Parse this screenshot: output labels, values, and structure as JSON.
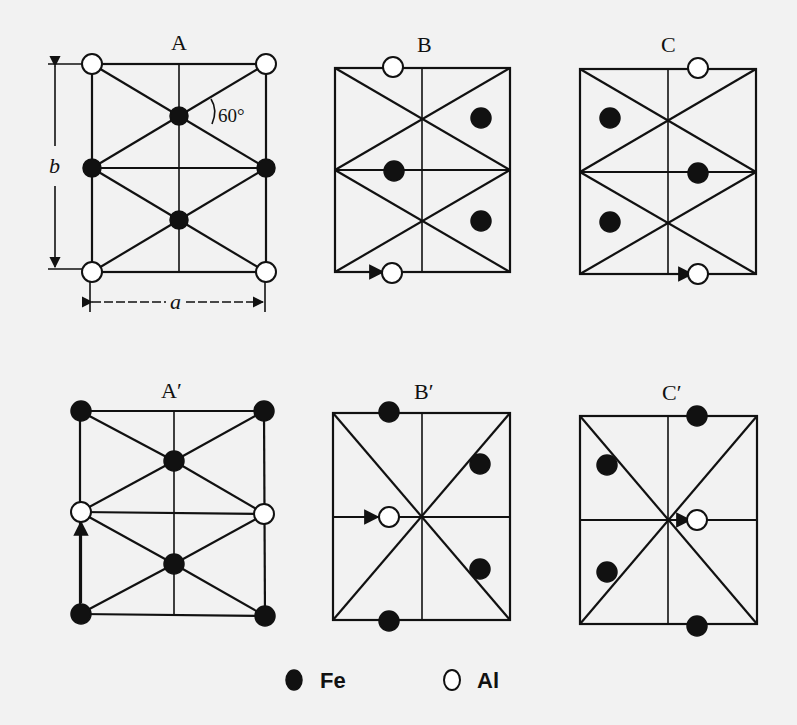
{
  "figure": {
    "panels": [
      {
        "id": "A",
        "label": "A",
        "angle_label": "60°",
        "dim_a": "a",
        "dim_b": "b"
      },
      {
        "id": "B",
        "label": "B"
      },
      {
        "id": "C",
        "label": "C"
      },
      {
        "id": "A_prime",
        "label": "A′"
      },
      {
        "id": "B_prime",
        "label": "B′"
      },
      {
        "id": "C_prime",
        "label": "C′"
      }
    ],
    "legend": {
      "fe": {
        "symbol": "filled-circle",
        "label": "Fe"
      },
      "al": {
        "symbol": "open-circle",
        "label": "Al"
      }
    }
  }
}
